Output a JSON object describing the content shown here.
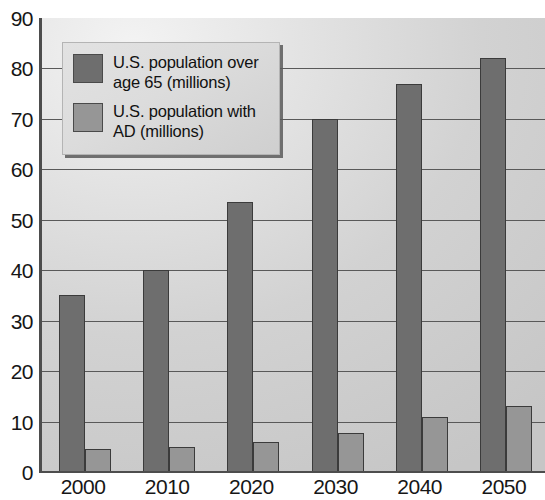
{
  "chart_data": {
    "type": "bar",
    "title": "",
    "subtitle": "",
    "xlabel": "",
    "ylabel": "",
    "grid": true,
    "legend_position": "top-left",
    "categories": [
      "2000",
      "2010",
      "2020",
      "2030",
      "2040",
      "2050"
    ],
    "ylim": [
      0,
      90
    ],
    "yticks": [
      0,
      10,
      20,
      30,
      40,
      50,
      60,
      70,
      80,
      90
    ],
    "series": [
      {
        "name": "U.S. population over age 65 (millions)",
        "color": "#6e6e6e",
        "values": [
          35,
          40,
          53.5,
          70,
          77,
          82
        ]
      },
      {
        "name": "U.S. population with AD (millions)",
        "color": "#969696",
        "values": [
          4.5,
          5,
          6,
          7.8,
          11,
          13
        ]
      }
    ]
  },
  "legend": {
    "items": [
      {
        "label_line1": "U.S. population over",
        "label_line2": "age 65 (millions)",
        "swatch": "dark"
      },
      {
        "label_line1": "U.S. population with",
        "label_line2": "AD (millions)",
        "swatch": "light"
      }
    ]
  },
  "colors": {
    "series_dark": "#6e6e6e",
    "series_light": "#969696",
    "plot_background": "#d2d2d2",
    "axis": "#4d4d4d",
    "gridline": "#595959",
    "legend_background": "#dcdcdc",
    "text": "#161616"
  }
}
